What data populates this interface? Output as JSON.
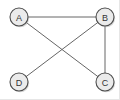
{
  "figure": {
    "width": 120,
    "height": 100,
    "background_color": "#ffffff"
  },
  "style": {
    "node_fill": "#ebebeb",
    "node_stroke": "#4d4d4d",
    "node_radius": 9,
    "label_color": "#333333",
    "edge_color": "#666666",
    "edge_width": 1,
    "shadow_color": "#b4b4b4"
  },
  "graph_data": {
    "type": "diagram",
    "directed": false,
    "node_count": 4,
    "edge_count": 4,
    "nodes": [
      {
        "id": "A",
        "label": "A",
        "x": 19,
        "y": 17,
        "position": "top-left"
      },
      {
        "id": "B",
        "label": "B",
        "x": 105,
        "y": 17,
        "position": "top-right"
      },
      {
        "id": "C",
        "label": "C",
        "x": 105,
        "y": 82,
        "position": "bottom-right"
      },
      {
        "id": "D",
        "label": "D",
        "x": 19,
        "y": 82,
        "position": "bottom-left"
      }
    ],
    "edges": [
      {
        "id": "edge-a-b",
        "source": "A",
        "target": "B",
        "kind": "horizontal-top"
      },
      {
        "id": "edge-b-c",
        "source": "B",
        "target": "C",
        "kind": "vertical-right"
      },
      {
        "id": "edge-a-c",
        "source": "A",
        "target": "C",
        "kind": "diagonal"
      },
      {
        "id": "edge-b-d",
        "source": "B",
        "target": "D",
        "kind": "diagonal"
      }
    ],
    "crossing_point": {
      "x": 62,
      "y": 49
    },
    "degrees": {
      "A": 2,
      "B": 3,
      "C": 2,
      "D": 1
    }
  }
}
